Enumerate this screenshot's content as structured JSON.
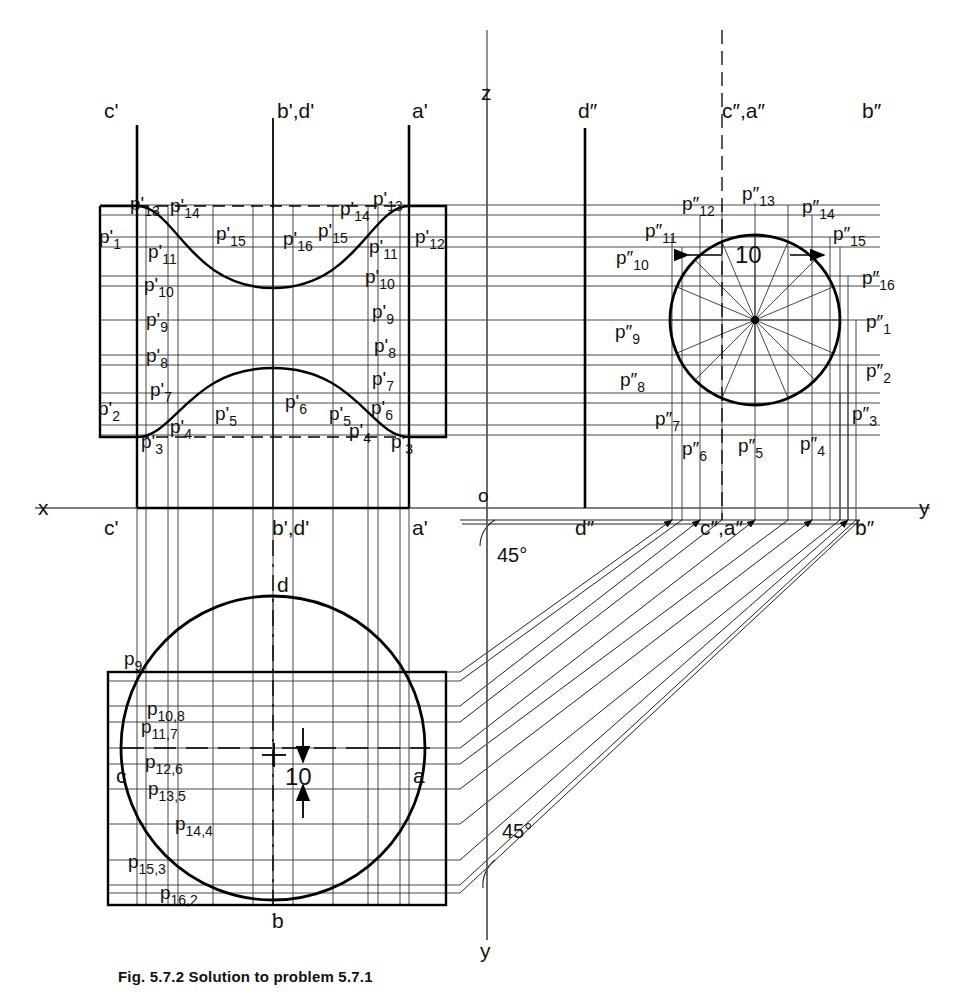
{
  "figure": {
    "domain_note": "Engineering descriptive-geometry drawing with front view, top view and side (profile) view",
    "caption": "Fig. 5.7.2  Solution to problem 5.7.1"
  },
  "axes": {
    "x_label": "x",
    "z_label": "z",
    "y_right_label": "y",
    "y_bottom_label": "y",
    "origin_label": "o",
    "angle_upper": "45°",
    "angle_lower": "45°"
  },
  "dimensions": {
    "profile_hole": "10",
    "plan_hole": "10"
  },
  "front_view": {
    "name": "front-view",
    "top_edge_labels": [
      "c'",
      "b',d'",
      "a'"
    ],
    "bottom_edge_labels": [
      "c'",
      "b',d'",
      "a'"
    ],
    "points_left": [
      {
        "id": "p13-left",
        "label": "p'",
        "sub": "13"
      },
      {
        "id": "p14-left",
        "label": "p'",
        "sub": "14"
      },
      {
        "id": "p1",
        "label": "p'",
        "sub": "1"
      },
      {
        "id": "p11-left",
        "label": "p'",
        "sub": "11"
      },
      {
        "id": "p10-left",
        "label": "p'",
        "sub": "10"
      },
      {
        "id": "p9-left",
        "label": "p'",
        "sub": "9"
      },
      {
        "id": "p8-left",
        "label": "p'",
        "sub": "8"
      },
      {
        "id": "p7-left",
        "label": "p'",
        "sub": "7"
      },
      {
        "id": "p2",
        "label": "p'",
        "sub": "2"
      },
      {
        "id": "p3-left",
        "label": "p'",
        "sub": "3"
      },
      {
        "id": "p4-left",
        "label": "p'",
        "sub": "4"
      },
      {
        "id": "p5-left",
        "label": "p'",
        "sub": "5"
      },
      {
        "id": "p15-left",
        "label": "p'",
        "sub": "15"
      }
    ],
    "points_middle": [
      {
        "id": "p16",
        "label": "p'",
        "sub": "16"
      },
      {
        "id": "p6",
        "label": "p'",
        "sub": "6"
      }
    ],
    "points_right": [
      {
        "id": "p13-right",
        "label": "p'",
        "sub": "13"
      },
      {
        "id": "p14-right",
        "label": "p'",
        "sub": "14"
      },
      {
        "id": "p15-right",
        "label": "p'",
        "sub": "15"
      },
      {
        "id": "p12",
        "label": "p'",
        "sub": "12"
      },
      {
        "id": "p11-right",
        "label": "p'",
        "sub": "11"
      },
      {
        "id": "p10-right",
        "label": "p'",
        "sub": "10"
      },
      {
        "id": "p9-right",
        "label": "p'",
        "sub": "9"
      },
      {
        "id": "p8-right",
        "label": "p'",
        "sub": "8"
      },
      {
        "id": "p7-right",
        "label": "p'",
        "sub": "7"
      },
      {
        "id": "p6-right",
        "label": "p'",
        "sub": "6"
      },
      {
        "id": "p5-right",
        "label": "p'",
        "sub": "5"
      },
      {
        "id": "p4-right",
        "label": "p'",
        "sub": "4"
      },
      {
        "id": "p3-right",
        "label": "p'",
        "sub": "3"
      }
    ]
  },
  "side_view": {
    "name": "side-view",
    "top_labels": [
      "d″",
      "c″,a″",
      "b″"
    ],
    "bottom_labels": [
      "d″",
      "c″,a″",
      "b″"
    ],
    "circle_points": [
      {
        "id": "pp1",
        "label": "p″",
        "sub": "1"
      },
      {
        "id": "pp2",
        "label": "p″",
        "sub": "2"
      },
      {
        "id": "pp3",
        "label": "p″",
        "sub": "3"
      },
      {
        "id": "pp4",
        "label": "p″",
        "sub": "4"
      },
      {
        "id": "pp5",
        "label": "p″",
        "sub": "5"
      },
      {
        "id": "pp6",
        "label": "p″",
        "sub": "6"
      },
      {
        "id": "pp7",
        "label": "p″",
        "sub": "7"
      },
      {
        "id": "pp8",
        "label": "p″",
        "sub": "8"
      },
      {
        "id": "pp9",
        "label": "p″",
        "sub": "9"
      },
      {
        "id": "pp10",
        "label": "p″",
        "sub": "10"
      },
      {
        "id": "pp11",
        "label": "p″",
        "sub": "11"
      },
      {
        "id": "pp12",
        "label": "p″",
        "sub": "12"
      },
      {
        "id": "pp13",
        "label": "p″",
        "sub": "13"
      },
      {
        "id": "pp14",
        "label": "p″",
        "sub": "14"
      },
      {
        "id": "pp15",
        "label": "p″",
        "sub": "15"
      },
      {
        "id": "pp16",
        "label": "p″",
        "sub": "16"
      }
    ]
  },
  "top_view": {
    "name": "top-view",
    "corner_labels": [
      "d",
      "c",
      "a",
      "b"
    ],
    "points": [
      {
        "id": "tp9",
        "label": "p",
        "sub": "9"
      },
      {
        "id": "tp10_8",
        "label": "p",
        "sub": "10,8"
      },
      {
        "id": "tp11_7",
        "label": "p",
        "sub": "11,7"
      },
      {
        "id": "tp12_6",
        "label": "p",
        "sub": "12,6"
      },
      {
        "id": "tp13_5",
        "label": "p",
        "sub": "13,5"
      },
      {
        "id": "tp14_4",
        "label": "p",
        "sub": "14,4"
      },
      {
        "id": "tp15_3",
        "label": "p",
        "sub": "15,3"
      },
      {
        "id": "tp16_2",
        "label": "p",
        "sub": "16,2"
      }
    ]
  },
  "colors": {
    "ink": "#000000",
    "thin": "#3a3a3a",
    "background": "#ffffff"
  }
}
